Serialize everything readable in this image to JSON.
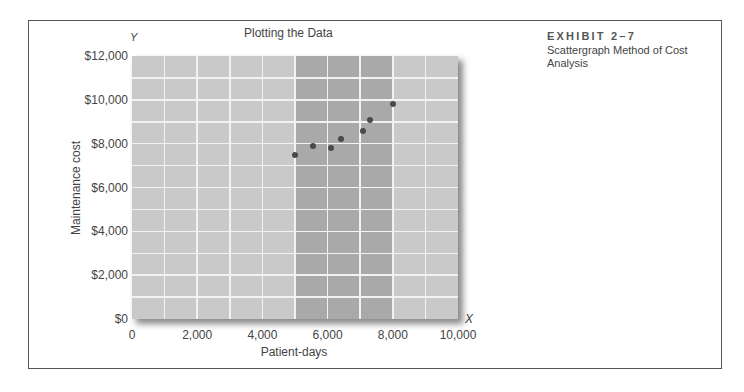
{
  "exhibit": {
    "number": "EXHIBIT 2–7",
    "description": "Scattergraph Method of Cost Analysis"
  },
  "chart": {
    "title": "Plotting the Data",
    "y_axis_letter": "Y",
    "x_axis_letter": "X",
    "xlabel": "Patient-days",
    "ylabel": "Maintenance cost",
    "y_ticks": [
      "$0",
      "$2,000",
      "$4,000",
      "$6,000",
      "$8,000",
      "$10,000",
      "$12,000"
    ],
    "x_ticks": [
      "0",
      "2,000",
      "4,000",
      "6,000",
      "8,000",
      "10,000"
    ],
    "colors": {
      "plot_bg": "#c9c9c9",
      "band": "#a9a9a9",
      "gridline": "#f2f2f2",
      "point": "#4a4a4a"
    }
  },
  "chart_data": {
    "type": "scatter",
    "title": "Plotting the Data",
    "xlabel": "Patient-days",
    "ylabel": "Maintenance cost",
    "xlim": [
      0,
      10000
    ],
    "ylim": [
      0,
      12000
    ],
    "x_ticks": [
      0,
      2000,
      4000,
      6000,
      8000,
      10000
    ],
    "y_ticks": [
      0,
      2000,
      4000,
      6000,
      8000,
      10000,
      12000
    ],
    "grid": true,
    "grid_step_x": 1000,
    "grid_step_y": 1000,
    "highlight_band_x": [
      5000,
      8000
    ],
    "legend": null,
    "series": [
      {
        "name": "Observations",
        "points": [
          {
            "x": 5000,
            "y": 7500
          },
          {
            "x": 5550,
            "y": 7900
          },
          {
            "x": 6100,
            "y": 7800
          },
          {
            "x": 6400,
            "y": 8200
          },
          {
            "x": 7100,
            "y": 8600
          },
          {
            "x": 7300,
            "y": 9100
          },
          {
            "x": 8000,
            "y": 9800
          }
        ]
      }
    ]
  }
}
